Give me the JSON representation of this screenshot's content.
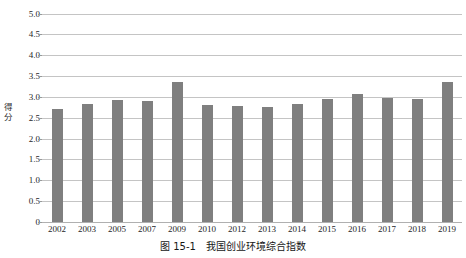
{
  "top_clipped_text": "",
  "chart_data": {
    "type": "bar",
    "title": "",
    "xlabel": "",
    "ylabel": "得分",
    "ylim": [
      0,
      5.0
    ],
    "ystep": 0.5,
    "grid": true,
    "legend": "none",
    "bar_color": "#7f7f7f",
    "gridline_color": "#c4c4c4",
    "ytick_labels": [
      "5.0",
      "4.5",
      "4.0",
      "3.5",
      "3.0",
      "2.5",
      "2.0",
      "1.5",
      "1.0",
      "0.5",
      "0"
    ],
    "ytick_values": [
      5.0,
      4.5,
      4.0,
      3.5,
      3.0,
      2.5,
      2.0,
      1.5,
      1.0,
      0.5,
      0
    ],
    "categories": [
      "2002",
      "2003",
      "2005",
      "2007",
      "2009",
      "2010",
      "2012",
      "2013",
      "2014",
      "2015",
      "2016",
      "2017",
      "2018",
      "2019"
    ],
    "values": [
      2.7,
      2.83,
      2.92,
      2.9,
      3.35,
      2.8,
      2.78,
      2.76,
      2.83,
      2.95,
      3.07,
      2.97,
      2.96,
      3.35
    ]
  },
  "caption": {
    "number": "图 15-1",
    "text": "我国创业环境综合指数"
  }
}
